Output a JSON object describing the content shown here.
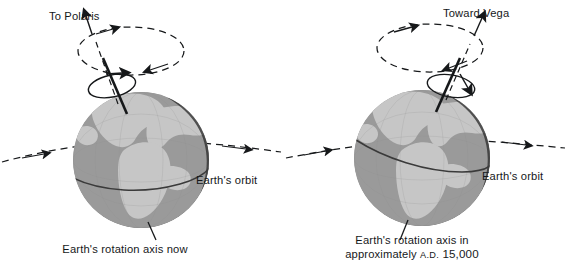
{
  "figure": {
    "kind": "axial-precession-diagram",
    "background": "#ffffff",
    "ink": "#16181a"
  },
  "palette": {
    "ocean": "#9a9a9a",
    "ocean_dark": "#6f6f6f",
    "land": "#c3c3c3",
    "land_dark": "#8f8f8f",
    "terminator": "#2a2a2a",
    "line": "#16181a",
    "grid": "#7d7d7d"
  },
  "panels": [
    {
      "id": "now",
      "star_label": "To Polaris",
      "orbit_label": "Earth's orbit",
      "caption_lines": [
        "Earth's rotation axis now"
      ],
      "axis_tilt_direction": "up-left",
      "equator_direction": "descending-left-to-right",
      "precession_circle": "dashed",
      "spin_arrow": "solid"
    },
    {
      "id": "ad15000",
      "star_label": "Toward Vega",
      "orbit_label": "Earth's orbit",
      "caption_lines": [
        "Earth's rotation axis in",
        "approximately A.D. 15,000"
      ],
      "caption_epoch_prefix": "approximately",
      "caption_epoch_era": "A.D.",
      "caption_epoch_year": "15,000",
      "axis_tilt_direction": "up-right",
      "equator_direction": "ascending-left-to-right",
      "precession_circle": "dashed",
      "spin_arrow": "solid"
    }
  ]
}
